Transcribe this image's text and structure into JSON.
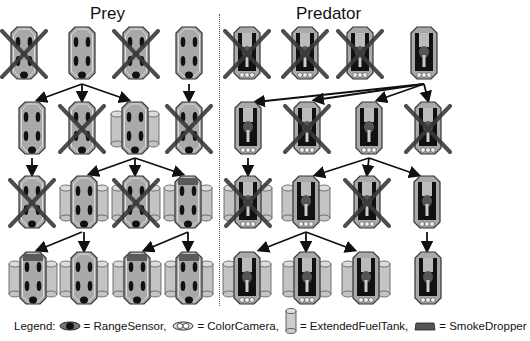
{
  "titles": {
    "prey": "Prey",
    "predator": "Predator"
  },
  "legend": {
    "prefix": "Legend:",
    "items": [
      {
        "icon": "range-sensor-icon",
        "label": "= RangeSensor,"
      },
      {
        "icon": "color-camera-icon",
        "label": "= ColorCamera,"
      },
      {
        "icon": "extended-fuel-tank-icon",
        "label": "= ExtendedFuelTank,"
      },
      {
        "icon": "smoke-dropper-icon",
        "label": "= SmokeDropper"
      }
    ]
  },
  "colors": {
    "body": "#a9a9a9",
    "body_outline": "#333333",
    "sensor": "#111111",
    "cross": "#3a3a3a",
    "tank": "#c4c4c4",
    "smoke": "#5a5a5a",
    "arrow": "#111111"
  },
  "prey_rows": [
    [
      {
        "x": 24,
        "y": 27,
        "killed": true,
        "tanks": false,
        "smoke": false
      },
      {
        "x": 82,
        "y": 27,
        "killed": false,
        "tanks": false,
        "smoke": false
      },
      {
        "x": 136,
        "y": 27,
        "killed": true,
        "tanks": false,
        "smoke": false
      },
      {
        "x": 189,
        "y": 27,
        "killed": false,
        "tanks": false,
        "smoke": false
      }
    ],
    [
      {
        "x": 32,
        "y": 102,
        "killed": false,
        "tanks": false,
        "smoke": false
      },
      {
        "x": 82,
        "y": 102,
        "killed": true,
        "tanks": false,
        "smoke": false
      },
      {
        "x": 135,
        "y": 102,
        "killed": false,
        "tanks": true,
        "smoke": false
      },
      {
        "x": 189,
        "y": 102,
        "killed": true,
        "tanks": false,
        "smoke": false
      }
    ],
    [
      {
        "x": 32,
        "y": 176,
        "killed": true,
        "tanks": false,
        "smoke": false
      },
      {
        "x": 84,
        "y": 176,
        "killed": false,
        "tanks": true,
        "smoke": false
      },
      {
        "x": 136,
        "y": 176,
        "killed": true,
        "tanks": true,
        "smoke": false
      },
      {
        "x": 188,
        "y": 176,
        "killed": false,
        "tanks": true,
        "smoke": true
      }
    ],
    [
      {
        "x": 33,
        "y": 252,
        "killed": false,
        "tanks": true,
        "smoke": true
      },
      {
        "x": 84,
        "y": 252,
        "killed": false,
        "tanks": true,
        "smoke": false
      },
      {
        "x": 137,
        "y": 252,
        "killed": false,
        "tanks": true,
        "smoke": true
      },
      {
        "x": 189,
        "y": 252,
        "killed": false,
        "tanks": true,
        "smoke": true
      }
    ]
  ],
  "predator_rows": [
    [
      {
        "x": 247,
        "y": 27,
        "killed": true,
        "tanks": false
      },
      {
        "x": 305,
        "y": 27,
        "killed": true,
        "tanks": false
      },
      {
        "x": 360,
        "y": 27,
        "killed": true,
        "tanks": false
      },
      {
        "x": 424,
        "y": 27,
        "killed": false,
        "tanks": false
      }
    ],
    [
      {
        "x": 248,
        "y": 102,
        "killed": false,
        "tanks": false
      },
      {
        "x": 307,
        "y": 102,
        "killed": true,
        "tanks": false
      },
      {
        "x": 369,
        "y": 102,
        "killed": false,
        "tanks": false
      },
      {
        "x": 428,
        "y": 102,
        "killed": true,
        "tanks": false
      }
    ],
    [
      {
        "x": 248,
        "y": 176,
        "killed": true,
        "tanks": true
      },
      {
        "x": 306,
        "y": 176,
        "killed": false,
        "tanks": true
      },
      {
        "x": 367,
        "y": 176,
        "killed": true,
        "tanks": false
      },
      {
        "x": 427,
        "y": 176,
        "killed": false,
        "tanks": false
      }
    ],
    [
      {
        "x": 247,
        "y": 252,
        "killed": false,
        "tanks": true
      },
      {
        "x": 307,
        "y": 252,
        "killed": false,
        "tanks": true
      },
      {
        "x": 366,
        "y": 252,
        "killed": false,
        "tanks": true
      },
      {
        "x": 428,
        "y": 252,
        "killed": false,
        "tanks": false
      }
    ]
  ],
  "arrows": [
    {
      "from": [
        82,
        84
      ],
      "to": [
        38,
        100
      ]
    },
    {
      "from": [
        82,
        84
      ],
      "to": [
        82,
        100
      ]
    },
    {
      "from": [
        82,
        84
      ],
      "to": [
        128,
        100
      ]
    },
    {
      "from": [
        189,
        84
      ],
      "to": [
        189,
        100
      ]
    },
    {
      "from": [
        32,
        158
      ],
      "to": [
        32,
        174
      ]
    },
    {
      "from": [
        135,
        158
      ],
      "to": [
        90,
        174
      ]
    },
    {
      "from": [
        135,
        158
      ],
      "to": [
        135,
        174
      ]
    },
    {
      "from": [
        135,
        158
      ],
      "to": [
        182,
        174
      ]
    },
    {
      "from": [
        82,
        232
      ],
      "to": [
        38,
        250
      ]
    },
    {
      "from": [
        84,
        232
      ],
      "to": [
        84,
        250
      ]
    },
    {
      "from": [
        188,
        232
      ],
      "to": [
        145,
        250
      ]
    },
    {
      "from": [
        188,
        232
      ],
      "to": [
        188,
        250
      ]
    },
    {
      "from": [
        424,
        84
      ],
      "to": [
        256,
        102
      ]
    },
    {
      "from": [
        424,
        84
      ],
      "to": [
        315,
        100
      ]
    },
    {
      "from": [
        424,
        84
      ],
      "to": [
        378,
        100
      ]
    },
    {
      "from": [
        424,
        84
      ],
      "to": [
        428,
        100
      ]
    },
    {
      "from": [
        248,
        158
      ],
      "to": [
        248,
        174
      ]
    },
    {
      "from": [
        369,
        158
      ],
      "to": [
        316,
        175
      ]
    },
    {
      "from": [
        369,
        158
      ],
      "to": [
        367,
        174
      ]
    },
    {
      "from": [
        369,
        158
      ],
      "to": [
        418,
        175
      ]
    },
    {
      "from": [
        306,
        232
      ],
      "to": [
        260,
        250
      ]
    },
    {
      "from": [
        306,
        232
      ],
      "to": [
        306,
        250
      ]
    },
    {
      "from": [
        306,
        232
      ],
      "to": [
        354,
        250
      ]
    },
    {
      "from": [
        427,
        232
      ],
      "to": [
        427,
        250
      ]
    }
  ]
}
